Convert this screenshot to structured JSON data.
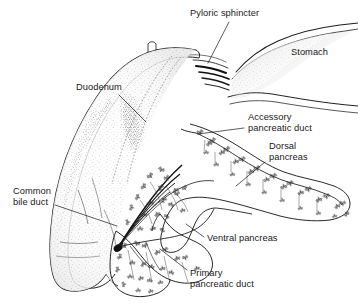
{
  "figure": {
    "style": "pen-and-ink stipple line drawing",
    "background_color": "#ffffff",
    "ink_color": "#1a1a1a"
  },
  "labels": {
    "pyloric_sphincter": "Pyloric sphincter",
    "stomach": "Stomach",
    "duodenum": "Duodenum",
    "accessory_duct_line1": "Accessory",
    "accessory_duct_line2": "pancreatic duct",
    "dorsal_pancreas_line1": "Dorsal",
    "dorsal_pancreas_line2": "pancreas",
    "common_bile_duct_line1": "Common",
    "common_bile_duct_line2": "bile duct",
    "ventral_pancreas": "Ventral pancreas",
    "primary_duct_line1": "Primary",
    "primary_duct_line2": "pancreatic duct"
  },
  "structures": [
    "duodenum",
    "stomach",
    "pyloric-sphincter",
    "dorsal-pancreas",
    "ventral-pancreas",
    "accessory-pancreatic-duct",
    "primary-pancreatic-duct",
    "common-bile-duct"
  ]
}
